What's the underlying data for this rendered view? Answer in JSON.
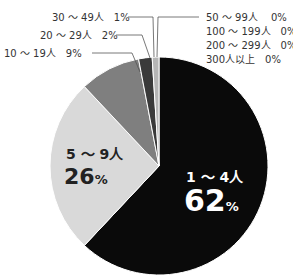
{
  "chart_data": {
    "type": "pie",
    "title": "",
    "categories": [
      "1〜4人",
      "5〜9人",
      "10〜19人",
      "20〜29人",
      "30〜49人",
      "50〜99人",
      "100〜199人",
      "200〜299人",
      "300人以上"
    ],
    "values": [
      62,
      26,
      9,
      2,
      1,
      0,
      0,
      0,
      0
    ],
    "unit": "%",
    "colors": [
      "#0a0a0a",
      "#d9d9d9",
      "#7f7f7f",
      "#3a3a3a",
      "#b5b5b5",
      "#ffffff",
      "#ffffff",
      "#ffffff",
      "#ffffff"
    ],
    "labels": {
      "s0_cat": "1 〜 4人",
      "s0_val": "62",
      "s0_unit": "%",
      "s1_cat": "5 〜 9人",
      "s1_val": "26",
      "s1_unit": "%",
      "s2": "10 〜 19人　9%",
      "s3": "20 〜 29人　2%",
      "s4": "30 〜 49人　1%",
      "s5": "50 〜 99人　 0%",
      "s6": "100 〜 199人　0%",
      "s7": "200 〜 299人　0%",
      "s8": "300人以上　0%"
    },
    "legend": "none (callout labels)"
  }
}
